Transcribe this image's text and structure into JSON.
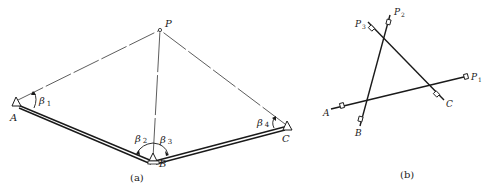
{
  "figure_a": {
    "caption": "(a)",
    "points": {
      "A": {
        "label": "A",
        "x": 16,
        "y": 102
      },
      "B": {
        "label": "B",
        "x": 153,
        "y": 160
      },
      "C": {
        "label": "C",
        "x": 287,
        "y": 126
      },
      "P": {
        "label": "P",
        "x": 160,
        "y": 30
      }
    },
    "angles": {
      "b1": {
        "symbol": "β",
        "sub": "1"
      },
      "b2": {
        "symbol": "β",
        "sub": "2"
      },
      "b3": {
        "symbol": "β",
        "sub": "3"
      },
      "b4": {
        "symbol": "β",
        "sub": "4"
      }
    }
  },
  "figure_b": {
    "caption": "(b)",
    "labels": {
      "A": "A",
      "B": "B",
      "C": "C",
      "P1": {
        "main": "P",
        "sub": "1"
      },
      "P2": {
        "main": "P",
        "sub": "2"
      },
      "P3": {
        "main": "P",
        "sub": "3"
      }
    }
  },
  "colors": {
    "stroke": "#1a1a1a",
    "background": "#ffffff"
  }
}
